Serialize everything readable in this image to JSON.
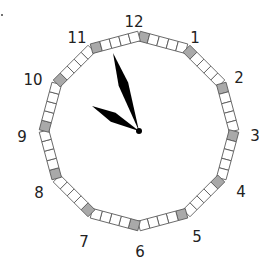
{
  "clock": {
    "center": [
      139,
      131
    ],
    "radius": 95,
    "hour_labels": [
      "12",
      "1",
      "2",
      "3",
      "4",
      "5",
      "6",
      "7",
      "8",
      "9",
      "10",
      "11"
    ],
    "label_positions": [
      [
        134,
        22
      ],
      [
        195,
        38
      ],
      [
        239,
        78
      ],
      [
        255,
        136
      ],
      [
        241,
        192
      ],
      [
        197,
        237
      ],
      [
        140,
        252
      ],
      [
        84,
        242
      ],
      [
        39,
        193
      ],
      [
        22,
        137
      ],
      [
        33,
        80
      ],
      [
        77,
        38
      ]
    ],
    "colors": {
      "hour_marker": "#a9a9a9",
      "minute_marker": "#ffffff",
      "marker_stroke": "#555555",
      "hands": "#000000",
      "labels": "#222222"
    },
    "time_shown": {
      "hour": 10,
      "minute": 58
    },
    "hands": {
      "hour_tip": [
        92,
        106
      ],
      "minute_tip": [
        113,
        53
      ]
    },
    "segments_per_hour": 5
  }
}
